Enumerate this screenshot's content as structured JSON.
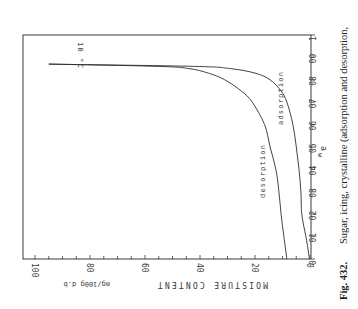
{
  "figure": {
    "number_label": "Fig. 432.",
    "caption": "Sugar, icing, crystalline (adsorption and desorption,",
    "temperature_label": "10 °C",
    "x_axis_label": "a",
    "x_axis_subscript": "w",
    "y_axis_label": "MOISTURE CONTENT",
    "y_axis_unit": "mg/100g d.b"
  },
  "x_ticks": [
    "0",
    "0.1",
    "0.2",
    "0.3",
    "0.4",
    "0.5",
    "0.6",
    "0.7",
    "0.8",
    "0.9",
    "1"
  ],
  "y_ticks": [
    "0",
    "20",
    "40",
    "60",
    "80",
    "100"
  ],
  "curve_labels": {
    "adsorption": "adsorption",
    "desorption": "desorption"
  },
  "chart_data": {
    "type": "line",
    "xlabel": "a_w",
    "ylabel": "MOISTURE CONTENT mg/100g d.b",
    "xlim": [
      0,
      1
    ],
    "ylim": [
      0,
      100
    ],
    "x_ticks": [
      0,
      0.1,
      0.2,
      0.3,
      0.4,
      0.5,
      0.6,
      0.7,
      0.8,
      0.9,
      1.0
    ],
    "y_ticks": [
      0,
      20,
      40,
      60,
      80,
      100
    ],
    "grid": false,
    "orientation_note": "figure printed rotated 90 degrees clockwise",
    "annotations": [
      "10 °C",
      "adsorption",
      "desorption"
    ],
    "series": [
      {
        "name": "desorption",
        "x": [
          0.0,
          0.1,
          0.2,
          0.3,
          0.4,
          0.5,
          0.6,
          0.7,
          0.75,
          0.8,
          0.83,
          0.85,
          0.86,
          0.87
        ],
        "y": [
          8.4,
          9.5,
          10.5,
          11.3,
          12.4,
          14.5,
          16.5,
          21,
          25,
          31,
          37,
          44,
          55,
          95
        ]
      },
      {
        "name": "adsorption",
        "x": [
          0.0,
          0.05,
          0.1,
          0.2,
          0.3,
          0.4,
          0.5,
          0.6,
          0.7,
          0.75,
          0.8,
          0.83,
          0.85,
          0.86,
          0.87
        ],
        "y": [
          0.2,
          0.8,
          1.5,
          3.0,
          3.3,
          4.0,
          5.0,
          6.2,
          8.4,
          10.5,
          14.5,
          20,
          29,
          42,
          95
        ]
      }
    ]
  }
}
